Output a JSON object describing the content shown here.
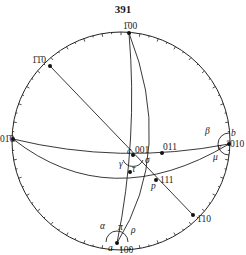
{
  "page_number": "391",
  "diagram": {
    "type": "stereographic-projection",
    "primitive_circle": {
      "cx": 121,
      "cy": 141,
      "r": 109
    },
    "poles": [
      {
        "id": "p-100bar",
        "label": "1̄ 00",
        "display": "Ā0 0",
        "x": 129,
        "y": 33,
        "lx": 123,
        "ly": 29
      },
      {
        "id": "p-1bar1bar0",
        "label": "1̄1̄0",
        "x": 50,
        "y": 66,
        "lx": 32,
        "ly": 63
      },
      {
        "id": "p-01bar0",
        "label": "01̄0",
        "x": 13,
        "y": 139,
        "lx": 0,
        "ly": 142
      },
      {
        "id": "p-010",
        "label": "010",
        "x": 229,
        "y": 144,
        "lx": 230,
        "ly": 147
      },
      {
        "id": "p-001",
        "label": "001",
        "x": 133,
        "y": 155,
        "lx": 135,
        "ly": 153
      },
      {
        "id": "p-011",
        "label": "011",
        "x": 162,
        "y": 153,
        "lx": 163,
        "ly": 150
      },
      {
        "id": "p-111",
        "label": "111",
        "x": 156,
        "y": 180,
        "lx": 160,
        "ly": 183
      },
      {
        "id": "p-1bar10",
        "label": "1̄10",
        "x": 193,
        "y": 215,
        "lx": 197,
        "ly": 222
      },
      {
        "id": "p-100",
        "label": "100",
        "x": 117,
        "y": 243,
        "lx": 119,
        "ly": 253
      },
      {
        "id": "p-mid",
        "label": "",
        "x": 130,
        "y": 172
      }
    ],
    "angle_labels": [
      {
        "id": "alpha",
        "text": "α",
        "x": 100,
        "y": 229
      },
      {
        "id": "pi",
        "text": "π",
        "x": 118,
        "y": 230
      },
      {
        "id": "rho",
        "text": "ρ",
        "x": 131,
        "y": 233
      },
      {
        "id": "a",
        "text": "a",
        "x": 108,
        "y": 251
      },
      {
        "id": "beta",
        "text": "β",
        "x": 205,
        "y": 134
      },
      {
        "id": "b",
        "text": "b",
        "x": 231,
        "y": 136
      },
      {
        "id": "nu",
        "text": "ν",
        "x": 217,
        "y": 150
      },
      {
        "id": "mu",
        "text": "μ",
        "x": 213,
        "y": 160
      },
      {
        "id": "gamma",
        "text": "γ",
        "x": 119,
        "y": 167
      },
      {
        "id": "sigma",
        "text": "σ",
        "x": 145,
        "y": 163
      },
      {
        "id": "tau",
        "text": "τ",
        "x": 132,
        "y": 172
      },
      {
        "id": "c",
        "text": "c",
        "x": 127,
        "y": 154
      },
      {
        "id": "p",
        "text": "p",
        "x": 151,
        "y": 189
      }
    ],
    "labels_text": {
      "top": "1̄00",
      "upper_left": "1̄1̄0",
      "left": "01̄0",
      "right": "010",
      "center": "001",
      "center_right": "011",
      "lower_center": "111",
      "lower_right": "1̄10",
      "bottom": "100"
    }
  }
}
